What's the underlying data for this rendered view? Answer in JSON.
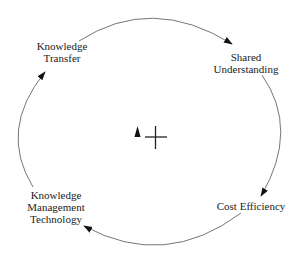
{
  "diagram": {
    "type": "causal-loop",
    "nodes": [
      {
        "id": "knowledge-transfer",
        "lines": [
          "Knowledge",
          "Transfer"
        ]
      },
      {
        "id": "shared-understanding",
        "lines": [
          "Shared",
          "Understanding"
        ]
      },
      {
        "id": "cost-efficiency",
        "lines": [
          "Cost Efficiency"
        ]
      },
      {
        "id": "km-technology",
        "lines": [
          "Knowledge",
          "Management",
          "Technology"
        ]
      }
    ],
    "links": [
      {
        "from": "knowledge-transfer",
        "to": "shared-understanding"
      },
      {
        "from": "shared-understanding",
        "to": "cost-efficiency"
      },
      {
        "from": "cost-efficiency",
        "to": "km-technology"
      },
      {
        "from": "km-technology",
        "to": "knowledge-transfer"
      }
    ],
    "loop_marker": {
      "type": "reinforcing",
      "direction_symbol": "triangle-up",
      "polarity": "+"
    },
    "colors": {
      "line": "#777777",
      "arrowhead": "#111111",
      "text": "#222222",
      "background": "#ffffff"
    }
  }
}
